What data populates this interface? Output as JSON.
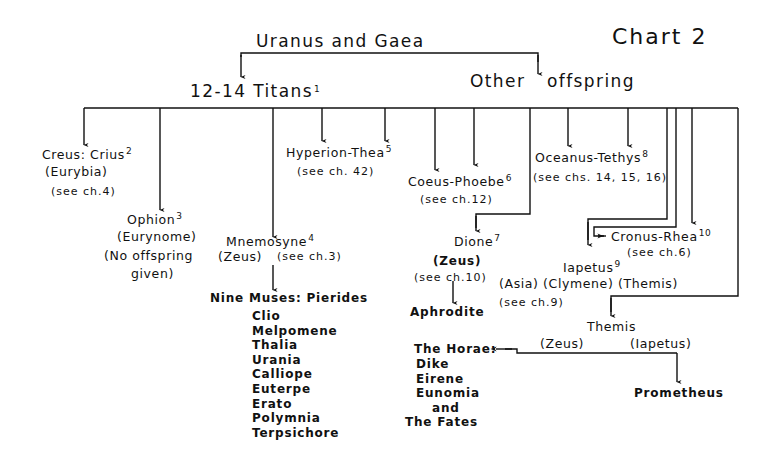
{
  "chart_title": "Chart 2",
  "root": "Uranus and Gaea",
  "branches": {
    "titans": {
      "label": "12-14 Titans",
      "note": "1"
    },
    "other": {
      "label_a": "Other",
      "label_b": "offspring"
    }
  },
  "nodes": {
    "creus": {
      "name": "Creus: Crius",
      "note": "2",
      "consort": "(Eurybia)",
      "ref": "(see ch.4)"
    },
    "ophion": {
      "name": "Ophion",
      "note": "3",
      "consort": "(Eurynome)",
      "ref_a": "(No offspring",
      "ref_b": "given)"
    },
    "mnemosyne": {
      "name": "Mnemosyne",
      "note": "4",
      "consort": "(Zeus)",
      "ref": "(see ch.3)"
    },
    "hyperion": {
      "name": "Hyperion-Thea",
      "note": "5",
      "ref": "(see ch. 42)"
    },
    "coeus": {
      "name": "Coeus-Phoebe",
      "note": "6",
      "ref": "(see ch.12)"
    },
    "dione": {
      "name": "Dione",
      "note": "7",
      "consort": "(Zeus)",
      "ref": "(see ch.10)"
    },
    "oceanus": {
      "name": "Oceanus-Tethys",
      "note": "8",
      "ref": "(see chs. 14, 15, 16)"
    },
    "cronus": {
      "name": "Cronus-Rhea",
      "note": "10",
      "ref": "(see ch.6)"
    },
    "iapetus": {
      "name": "Iapetus",
      "note": "9",
      "consorts": "(Asia) (Clymene) (Themis)",
      "ref": "(see ch.9)"
    },
    "themis": {
      "name": "Themis",
      "consort_left": "(Zeus)",
      "consort_right": "(Iapetus)"
    },
    "aphrodite": {
      "name": "Aphrodite"
    },
    "prometheus": {
      "name": "Prometheus"
    }
  },
  "muses": {
    "heading": "Nine Muses: Pierides",
    "names": [
      "Clio",
      "Melpomene",
      "Thalia",
      "Urania",
      "Calliope",
      "Euterpe",
      "Erato",
      "Polymnia",
      "Terpsichore"
    ]
  },
  "horae": {
    "heading": "The Horae:",
    "names": [
      "Dike",
      "Eirene",
      "Eunomia"
    ],
    "and": "and",
    "fates": "The Fates"
  },
  "colors": {
    "ink": "#111111",
    "paper": "#ffffff"
  }
}
